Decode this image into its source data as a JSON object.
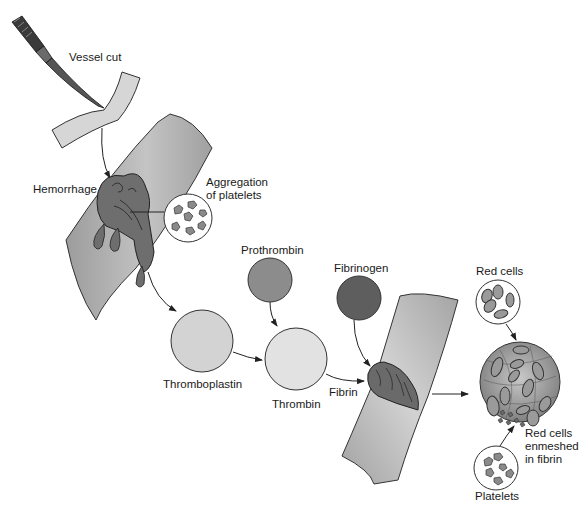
{
  "diagram": {
    "labels": {
      "vessel_cut": "Vessel cut",
      "hemorrhage": "Hemorrhage",
      "aggregation_line1": "Aggregation",
      "aggregation_line2": "of platelets",
      "prothrombin": "Prothrombin",
      "fibrinogen": "Fibrinogen",
      "thromboplastin": "Thromboplastin",
      "thrombin": "Thrombin",
      "fibrin": "Fibrin",
      "red_cells": "Red cells",
      "enmeshed_line1": "Red cells",
      "enmeshed_line2": "enmeshed",
      "enmeshed_line3": "in fibrin",
      "platelets": "Platelets"
    },
    "nodes": [
      {
        "id": "vessel-cut",
        "label": "Vessel cut",
        "shape": "vessel+scalpel"
      },
      {
        "id": "hemorrhage",
        "label": "Hemorrhage",
        "shape": "vessel+clot"
      },
      {
        "id": "aggregation",
        "label": "Aggregation of platelets",
        "shape": "circle-inset"
      },
      {
        "id": "thromboplastin",
        "label": "Thromboplastin",
        "shape": "circle",
        "fill": "#d3d3d3"
      },
      {
        "id": "prothrombin",
        "label": "Prothrombin",
        "shape": "circle",
        "fill": "#8c8c8c"
      },
      {
        "id": "thrombin",
        "label": "Thrombin",
        "shape": "circle",
        "fill": "#e2e2e2"
      },
      {
        "id": "fibrinogen",
        "label": "Fibrinogen",
        "shape": "circle",
        "fill": "#5e5e5e"
      },
      {
        "id": "fibrin-clot",
        "label": "Fibrin",
        "shape": "vessel+clot"
      },
      {
        "id": "red-cells",
        "label": "Red cells",
        "shape": "circle-inset"
      },
      {
        "id": "platelets",
        "label": "Platelets",
        "shape": "circle-inset"
      },
      {
        "id": "enmeshed",
        "label": "Red cells enmeshed in fibrin",
        "shape": "circle-inset-large"
      }
    ],
    "edges": [
      {
        "from": "vessel-cut",
        "to": "hemorrhage"
      },
      {
        "from": "hemorrhage",
        "to": "thromboplastin"
      },
      {
        "from": "thromboplastin",
        "to": "thrombin"
      },
      {
        "from": "prothrombin",
        "to": "thrombin"
      },
      {
        "from": "thrombin",
        "to": "fibrin-clot",
        "label": "Fibrin"
      },
      {
        "from": "fibrinogen",
        "to": "fibrin-clot"
      },
      {
        "from": "fibrin-clot",
        "to": "enmeshed"
      },
      {
        "from": "red-cells",
        "to": "enmeshed"
      },
      {
        "from": "platelets",
        "to": "enmeshed"
      }
    ],
    "colors": {
      "vessel": "#a8a8a8",
      "vessel_light": "#c9c9c9",
      "clot": "#6a6a6a",
      "outline": "#333333",
      "thromboplastin": "#d3d3d3",
      "prothrombin": "#8c8c8c",
      "thrombin": "#e2e2e2",
      "fibrinogen": "#5e5e5e"
    }
  }
}
